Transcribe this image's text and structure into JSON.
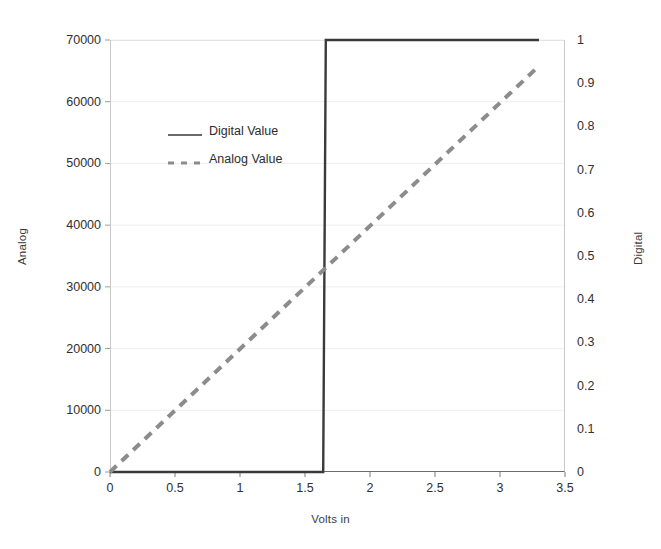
{
  "chart_data": {
    "type": "line",
    "title": "",
    "xlabel": "Volts in",
    "ylabel": "Analog",
    "y2label": "Digital",
    "grid": true,
    "legend_position": "inside-upper-left",
    "xlim": [
      0,
      3.5
    ],
    "ylim": [
      0,
      70000
    ],
    "y2lim": [
      0,
      1
    ],
    "xticks": [
      "0",
      "0.5",
      "1",
      "1.5",
      "2",
      "2.5",
      "3",
      "3.5"
    ],
    "xtick_values": [
      0,
      0.5,
      1,
      1.5,
      2,
      2.5,
      3,
      3.5
    ],
    "yticks": [
      "0",
      "10000",
      "20000",
      "30000",
      "40000",
      "50000",
      "60000",
      "70000"
    ],
    "ytick_values": [
      0,
      10000,
      20000,
      30000,
      40000,
      50000,
      60000,
      70000
    ],
    "y2ticks": [
      "0",
      "0.1",
      "0.2",
      "0.3",
      "0.4",
      "0.5",
      "0.6",
      "0.7",
      "0.8",
      "0.9",
      "1"
    ],
    "y2tick_values": [
      0,
      0.1,
      0.2,
      0.3,
      0.4,
      0.5,
      0.6,
      0.7,
      0.8,
      0.9,
      1
    ],
    "series": [
      {
        "name": "Digital Value",
        "axis": "right",
        "style": "solid",
        "color": "#3a3a3a",
        "width": 2.4,
        "x": [
          0,
          1.64,
          1.66,
          3.3
        ],
        "values": [
          0,
          0,
          1,
          1
        ],
        "note": "step/comparator output: 0 below threshold, 1 above",
        "threshold_volts": 1.65
      },
      {
        "name": "Analog Value",
        "axis": "right",
        "style": "dashed",
        "color": "#8c8c8c",
        "width": 4,
        "x": [
          0,
          3.3
        ],
        "values": [
          0,
          0.94
        ],
        "note": "linear ramp, proportional to volts in"
      }
    ]
  },
  "legend": {
    "items": [
      {
        "label": "Digital Value",
        "style": "solid",
        "color": "#3a3a3a"
      },
      {
        "label": "Analog Value",
        "style": "dashed",
        "color": "#8c8c8c"
      }
    ]
  },
  "colors": {
    "digital_line": "#3a3a3a",
    "analog_line": "#8c8c8c",
    "grid": "#eeeeee",
    "axis": "#6d6d6d",
    "text": "#2f2f2f",
    "background": "#ffffff"
  }
}
